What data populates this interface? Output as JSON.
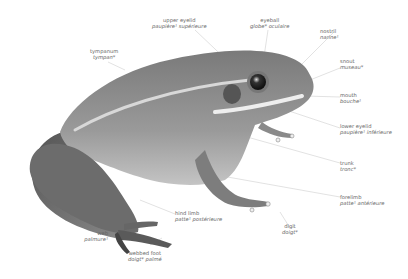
{
  "diagram": {
    "style": "grayscale illustration with bilingual labels",
    "colors": {
      "label_text": "#666666",
      "leader_line": "#c8c8c8",
      "background": "#ffffff"
    }
  },
  "labels": [
    {
      "id": "upper-eyelid",
      "en": "upper eyelid",
      "fr": "paupière¹ supérieure"
    },
    {
      "id": "eyeball",
      "en": "eyeball",
      "fr": "globe* oculaire"
    },
    {
      "id": "nostril",
      "en": "nostril",
      "fr": "narine¹"
    },
    {
      "id": "tympanum",
      "en": "tympanum",
      "fr": "tympan*"
    },
    {
      "id": "snout",
      "en": "snout",
      "fr": "museau*"
    },
    {
      "id": "mouth",
      "en": "mouth",
      "fr": "bouche¹"
    },
    {
      "id": "lower-eyelid",
      "en": "lower eyelid",
      "fr": "paupière¹ inférieure"
    },
    {
      "id": "trunk",
      "en": "trunk",
      "fr": "tronc*"
    },
    {
      "id": "forelimb",
      "en": "forelimb",
      "fr": "patte¹ antérieure"
    },
    {
      "id": "digit",
      "en": "digit",
      "fr": "doigt*"
    },
    {
      "id": "hind-limb",
      "en": "hind limb",
      "fr": "patte¹ postérieure"
    },
    {
      "id": "web",
      "en": "web",
      "fr": "palmure¹"
    },
    {
      "id": "webbed-foot",
      "en": "webbed foot",
      "fr": "doigt* palmé"
    }
  ]
}
